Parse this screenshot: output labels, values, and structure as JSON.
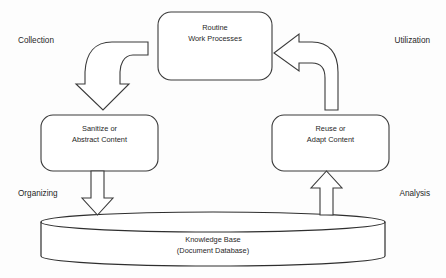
{
  "diagram": {
    "background_color": "#fdfdfd",
    "stroke_color": "#3a3a3a",
    "fill_color": "#ffffff",
    "text_color": "#1f1f1f"
  },
  "nodes": {
    "routine": {
      "name": "routine-work-processes",
      "line1": "Routine",
      "line2": "Work Processes"
    },
    "sanitize": {
      "name": "sanitize-abstract-content",
      "line1": "Sanitize or",
      "line2": "Abstract Content"
    },
    "reuse": {
      "name": "reuse-adapt-content",
      "line1": "Reuse or",
      "line2": "Adapt Content"
    },
    "knowledge_base": {
      "name": "knowledge-base-cylinder",
      "line1": "Knowledge Base",
      "line2": "(Document Database)"
    }
  },
  "corner_labels": {
    "top_left": "Collection",
    "top_right": "Utilization",
    "bottom_left": "Organizing",
    "bottom_right": "Analysis"
  },
  "arrows": {
    "collection": {
      "name": "curved-arrow-collection",
      "from": "Routine Work Processes",
      "to": "Sanitize or Abstract Content",
      "direction": "down"
    },
    "organizing": {
      "name": "block-arrow-organizing",
      "from": "Sanitize or Abstract Content",
      "to": "Knowledge Base",
      "direction": "down"
    },
    "analysis": {
      "name": "block-arrow-analysis",
      "from": "Knowledge Base",
      "to": "Reuse or Adapt Content",
      "direction": "up"
    },
    "utilization": {
      "name": "curved-arrow-utilization",
      "from": "Reuse or Adapt Content",
      "to": "Routine Work Processes",
      "direction": "left"
    }
  }
}
